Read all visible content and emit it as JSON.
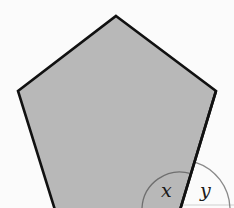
{
  "diagram": {
    "shape": "regular-pentagon",
    "fill_color": "#b8b8b8",
    "stroke_color": "#111111",
    "vertices": [
      [
        116,
        16
      ],
      [
        216,
        91
      ],
      [
        180,
        210
      ],
      [
        55,
        210
      ],
      [
        18,
        91
      ]
    ],
    "angles": [
      {
        "label": "x",
        "type": "interior",
        "vertex": [
          180,
          210
        ],
        "radius": 38
      },
      {
        "label": "y",
        "type": "exterior",
        "vertex": [
          180,
          210
        ],
        "radius": 50
      }
    ]
  }
}
